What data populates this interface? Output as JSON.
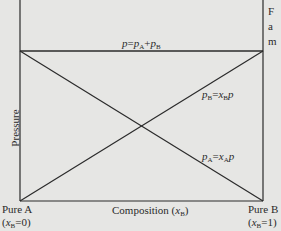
{
  "diagram": {
    "axes": {
      "y_label": "Pressure",
      "x_label_main": "Composition (",
      "x_label_var": "x",
      "x_label_sub": "B",
      "x_label_close": ")"
    },
    "endpoints": {
      "left": {
        "line1": "Pure A",
        "line2_open": "(",
        "var": "x",
        "sub": "B",
        "line2_rest": "=0)"
      },
      "right": {
        "line1": "Pure B",
        "line2_open": "(",
        "var": "x",
        "sub": "B",
        "line2_rest": "=1)"
      }
    },
    "lines": {
      "total": {
        "label_lhs": "p",
        "label_eq": "=",
        "term1": "p",
        "term1_sub": "A",
        "plus": "+",
        "term2": "p",
        "term2_sub": "B"
      },
      "pB": {
        "lhs": "p",
        "lhs_sub": "B",
        "eq": "=",
        "x": "x",
        "x_sub": "B",
        "p": "p"
      },
      "pA": {
        "lhs": "p",
        "lhs_sub": "A",
        "eq": "=",
        "x": "x",
        "x_sub": "A",
        "p": "p"
      }
    },
    "edge_text_fragments": [
      "F",
      "a",
      "m"
    ],
    "colors": {
      "line": "#2b2b2b",
      "background": "#e6e6e4"
    }
  }
}
